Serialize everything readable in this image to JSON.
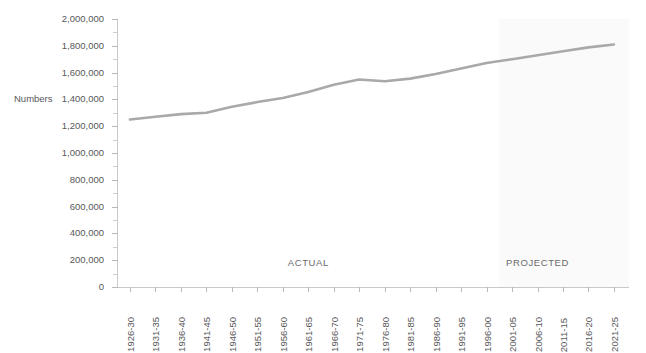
{
  "title_remnant": "",
  "axis": {
    "y_title": "Numbers",
    "y_ticks": [
      "2,000,000",
      "1,800,000",
      "1,600,000",
      "1,400,000",
      "1,200,000",
      "1,000,000",
      "800,000",
      "600,000",
      "400,000",
      "200,000",
      "0"
    ],
    "y_min": 0,
    "y_max": 2000000,
    "y_step": 200000,
    "x_ticks": [
      "1926-30",
      "1931-35",
      "1936-40",
      "1941-45",
      "1946-50",
      "1951-55",
      "1956-60",
      "1961-65",
      "1966-70",
      "1971-75",
      "1976-80",
      "1981-85",
      "1986-90",
      "1991-95",
      "1996-00",
      "2001-05",
      "2006-10",
      "2011-15",
      "2016-20",
      "2021-25"
    ]
  },
  "annotations": {
    "actual_label": "ACTUAL",
    "projected_label": "PROJECTED"
  },
  "colors": {
    "line": "#a9a9a9",
    "axis": "#c4c4c4",
    "text": "#58585a",
    "projected_band": "#fafafa",
    "background": "#ffffff"
  },
  "chart_data": {
    "type": "line",
    "title": "",
    "subtitle": "",
    "xlabel": "",
    "ylabel": "Numbers",
    "ylim": [
      0,
      2000000
    ],
    "grid": false,
    "legend": "none",
    "categories": [
      "1926-30",
      "1931-35",
      "1936-40",
      "1941-45",
      "1946-50",
      "1951-55",
      "1956-60",
      "1961-65",
      "1966-70",
      "1971-75",
      "1976-80",
      "1981-85",
      "1986-90",
      "1991-95",
      "1996-00",
      "2001-05",
      "2006-10",
      "2011-15",
      "2016-20",
      "2021-25"
    ],
    "series": [
      {
        "name": "Numbers",
        "values": [
          1250000,
          1270000,
          1290000,
          1300000,
          1345000,
          1380000,
          1410000,
          1455000,
          1510000,
          1548000,
          1535000,
          1555000,
          1590000,
          1630000,
          1672000,
          1700000,
          1730000,
          1760000,
          1788000,
          1810000
        ]
      }
    ],
    "annotations": [
      {
        "text": "ACTUAL",
        "category": "1961-65",
        "value": 190000
      },
      {
        "text": "PROJECTED",
        "category": "2006-10",
        "value": 190000
      }
    ],
    "shaded_regions": [
      {
        "label": "PROJECTED",
        "from_category": "2001-05",
        "to_category": "2021-25",
        "color": "#fafafa"
      }
    ]
  }
}
